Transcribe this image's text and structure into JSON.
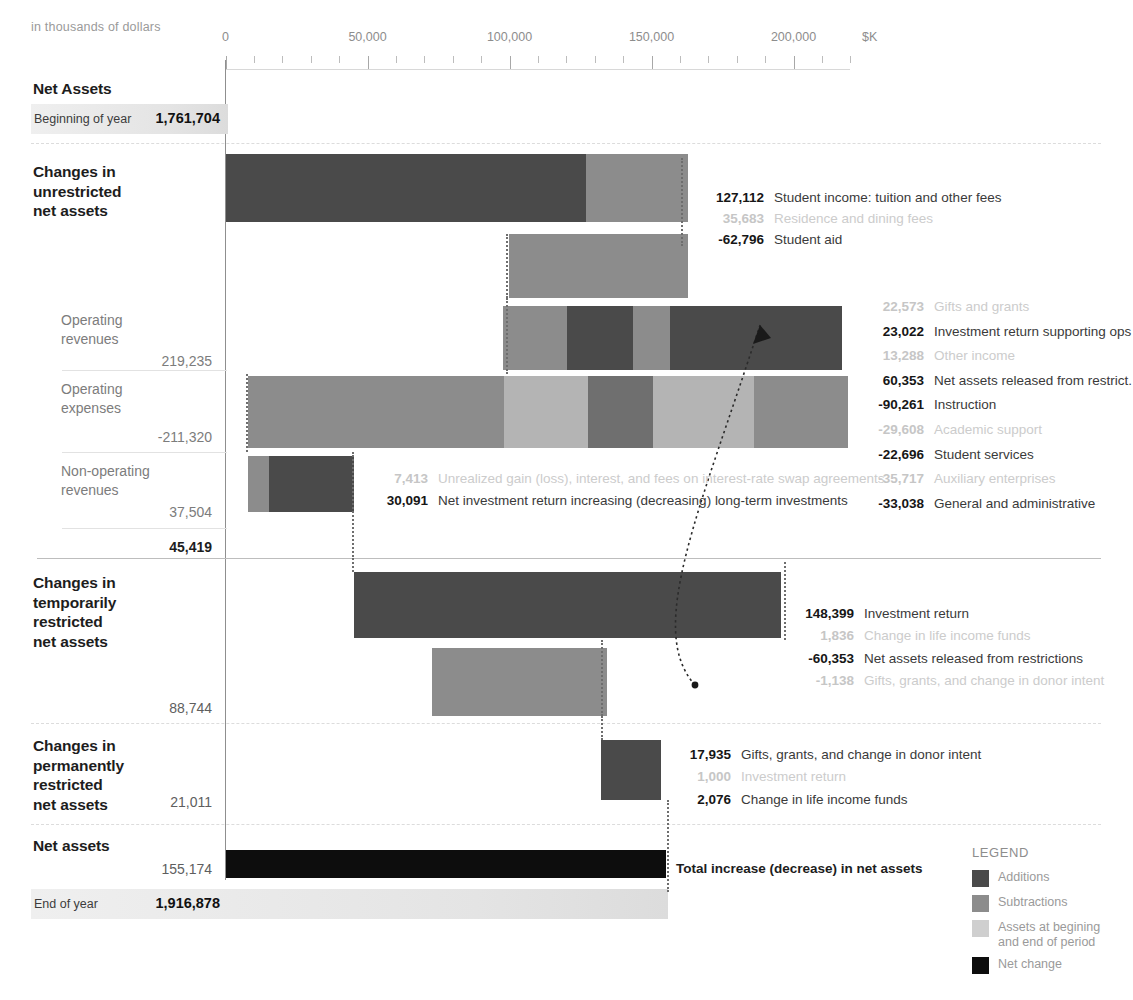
{
  "subtitle": "in thousands of dollars",
  "colors": {
    "addition": "#4a4a4a",
    "subtraction": "#8c8c8c",
    "assets": "#dcdcdc",
    "net_change": "#0d0d0d",
    "axis": "#8f8f8f",
    "dim_text": "#c8c8c8"
  },
  "axis": {
    "unit_label": "$K",
    "ticks": [
      {
        "value": 0,
        "label": "0"
      },
      {
        "value": 50000,
        "label": "50,000"
      },
      {
        "value": 100000,
        "label": "100,000"
      },
      {
        "value": 150000,
        "label": "150,000"
      },
      {
        "value": 200000,
        "label": "200,000"
      }
    ],
    "min": 0,
    "max": 220000,
    "minor_step": 10000
  },
  "net_assets_begin": {
    "section_title": "Net Assets",
    "row_label": "Beginning of year",
    "value": "1,761,704"
  },
  "net_assets_end": {
    "section_title": "Net assets",
    "row_label": "End of year",
    "value": "1,916,878",
    "net_change_value": "155,174",
    "net_change_label": "Total increase (decrease) in net assets"
  },
  "sections": [
    {
      "title": "Changes in\nunrestricted\nnet assets",
      "subtotal": "45,419",
      "subgroups": [
        {
          "label": "Operating\nrevenues",
          "total": "219,235"
        },
        {
          "label": "Operating\nexpenses",
          "total": "-211,320"
        },
        {
          "label": "Non-operating\nrevenues",
          "total": "37,504"
        }
      ]
    },
    {
      "title": "Changes in\ntemporarily\nrestricted\nnet assets",
      "subtotal": "88,744"
    },
    {
      "title": "Changes in\npermanently\nrestricted\nnet assets",
      "subtotal": "21,011"
    }
  ],
  "legend": {
    "title": "LEGEND",
    "items": [
      {
        "label": "Additions",
        "color": "#4a4a4a"
      },
      {
        "label": "Subtractions",
        "color": "#8c8c8c"
      },
      {
        "label": "Assets at begining\nand end of period",
        "color": "#cfcfcf"
      },
      {
        "label": "Net change",
        "color": "#0d0d0d"
      }
    ]
  },
  "chart_data": {
    "type": "bar",
    "chart_style": "waterfall-financial-statement",
    "title": "",
    "subtitle": "in thousands of dollars",
    "xlabel": "$K",
    "ylabel": "",
    "xlim": [
      0,
      220000
    ],
    "grid": false,
    "legend_position": "bottom-right",
    "axis_ticks": [
      0,
      50000,
      100000,
      150000,
      200000
    ],
    "bars": [
      {
        "id": "beginning-of-year",
        "group": "Net Assets",
        "row_label": "Beginning of year",
        "total": 1761704,
        "kind": "assets",
        "segments": []
      },
      {
        "id": "unrestricted-revenue-row-1",
        "group": "Changes in unrestricted net assets",
        "start": 0,
        "segments": [
          {
            "label": "Student income: tuition and other fees",
            "value": 127112,
            "kind": "addition",
            "emphasis": "strong"
          },
          {
            "label": "Residence and dining fees",
            "value": 35683,
            "kind": "subtraction",
            "emphasis": "dim"
          }
        ]
      },
      {
        "id": "unrestricted-revenue-row-2",
        "group": "Changes in unrestricted net assets",
        "start": 162795,
        "segments": [
          {
            "label": "Student aid",
            "value": -62796,
            "kind": "subtraction",
            "emphasis": "strong"
          }
        ]
      },
      {
        "id": "operating-revenues",
        "group": "Operating revenues",
        "subtotal": 219235,
        "start": 99999,
        "segments": [
          {
            "label": "Gifts and grants",
            "value": 22573,
            "kind": "subtraction",
            "emphasis": "dim"
          },
          {
            "label": "Investment return supporting ops",
            "value": 23022,
            "kind": "addition",
            "emphasis": "strong"
          },
          {
            "label": "Other income",
            "value": 13288,
            "kind": "subtraction",
            "emphasis": "dim"
          },
          {
            "label": "Net assets released from restrict.",
            "value": 60353,
            "kind": "addition",
            "emphasis": "strong"
          }
        ]
      },
      {
        "id": "operating-expenses",
        "group": "Operating expenses",
        "subtotal": -211320,
        "start": 7900,
        "segments": [
          {
            "label": "Instruction",
            "value": -90261,
            "kind": "subtraction",
            "emphasis": "strong"
          },
          {
            "label": "Academic support",
            "value": -29608,
            "kind": "assets",
            "emphasis": "dim"
          },
          {
            "label": "Student services",
            "value": -22696,
            "kind": "subtraction-dark",
            "emphasis": "strong"
          },
          {
            "label": "Auxiliary enterprises",
            "value": -35717,
            "kind": "assets",
            "emphasis": "dim"
          },
          {
            "label": "General and administrative",
            "value": -33038,
            "kind": "subtraction",
            "emphasis": "strong"
          }
        ]
      },
      {
        "id": "non-operating-revenues",
        "group": "Non-operating revenues",
        "subtotal": 37504,
        "start": 7900,
        "segments": [
          {
            "label": "Unrealized gain (loss), interest, and fees on interest-rate swap agreements",
            "value": 7413,
            "kind": "subtraction",
            "emphasis": "dim"
          },
          {
            "label": "Net investment return increasing (decreasing) long-term investments",
            "value": 30091,
            "kind": "addition",
            "emphasis": "strong"
          }
        ]
      },
      {
        "id": "unrestricted-subtotal",
        "group": "Changes in unrestricted net assets",
        "subtotal": 45419
      },
      {
        "id": "temporarily-restricted-row-1",
        "group": "Changes in temporarily restricted net assets",
        "start": 45419,
        "segments": [
          {
            "label": "Investment return",
            "value": 148399,
            "kind": "addition",
            "emphasis": "strong"
          },
          {
            "label": "Change in life income funds",
            "value": 1836,
            "kind": "addition",
            "emphasis": "dim"
          }
        ]
      },
      {
        "id": "temporarily-restricted-row-2",
        "group": "Changes in temporarily restricted net assets",
        "start": 134353,
        "segments": [
          {
            "label": "Net assets released from restrictions",
            "value": -60353,
            "kind": "subtraction",
            "emphasis": "strong"
          },
          {
            "label": "Gifts, grants, and change in donor intent",
            "value": -1138,
            "kind": "subtraction",
            "emphasis": "dim"
          }
        ]
      },
      {
        "id": "temporarily-restricted-subtotal",
        "group": "Changes in temporarily restricted net assets",
        "subtotal": 88744
      },
      {
        "id": "permanently-restricted",
        "group": "Changes in permanently restricted net assets",
        "subtotal": 21011,
        "start": 132300,
        "segments": [
          {
            "label": "Gifts, grants, and change in donor intent",
            "value": 17935,
            "kind": "addition",
            "emphasis": "strong"
          },
          {
            "label": "Investment return",
            "value": 1000,
            "kind": "addition",
            "emphasis": "dim"
          },
          {
            "label": "Change in life income funds",
            "value": 2076,
            "kind": "addition",
            "emphasis": "strong"
          }
        ]
      },
      {
        "id": "net-change",
        "group": "Net assets",
        "total": 155174,
        "kind": "net_change",
        "label": "Total increase (decrease) in net assets"
      },
      {
        "id": "end-of-year",
        "group": "Net assets",
        "row_label": "End of year",
        "total": 1916878,
        "kind": "assets"
      }
    ]
  },
  "annotations": {
    "unrestricted_top": [
      {
        "value": "127,112",
        "text": "Student income: tuition and other fees",
        "dim": false
      },
      {
        "value": "35,683",
        "text": "Residence and dining fees",
        "dim": true
      },
      {
        "value": "-62,796",
        "text": "Student aid",
        "dim": false
      }
    ],
    "operating": [
      {
        "value": "22,573",
        "text": "Gifts and grants",
        "dim": true
      },
      {
        "value": "23,022",
        "text": "Investment return supporting ops",
        "dim": false
      },
      {
        "value": "13,288",
        "text": "Other income",
        "dim": true
      },
      {
        "value": "60,353",
        "text": "Net assets released from restrict.",
        "dim": false
      },
      {
        "value": "-90,261",
        "text": "Instruction",
        "dim": false
      },
      {
        "value": "-29,608",
        "text": "Academic support",
        "dim": true
      },
      {
        "value": "-22,696",
        "text": "Student services",
        "dim": false
      },
      {
        "value": "-35,717",
        "text": "Auxiliary enterprises",
        "dim": true
      },
      {
        "value": "-33,038",
        "text": "General and administrative",
        "dim": false
      }
    ],
    "nonoperating": [
      {
        "value": "7,413",
        "text": "Unrealized gain (loss), interest, and fees on interest-rate swap agreements",
        "dim": true
      },
      {
        "value": "30,091",
        "text": "Net investment return increasing (decreasing) long-term investments",
        "dim": false
      }
    ],
    "temporarily": [
      {
        "value": "148,399",
        "text": "Investment return",
        "dim": false
      },
      {
        "value": "1,836",
        "text": "Change in life income funds",
        "dim": true
      },
      {
        "value": "-60,353",
        "text": "Net assets released from restrictions",
        "dim": false
      },
      {
        "value": "-1,138",
        "text": "Gifts, grants, and change in donor intent",
        "dim": true
      }
    ],
    "permanently": [
      {
        "value": "17,935",
        "text": "Gifts, grants, and change in donor intent",
        "dim": false
      },
      {
        "value": "1,000",
        "text": "Investment return",
        "dim": true
      },
      {
        "value": "2,076",
        "text": "Change in life income funds",
        "dim": false
      }
    ]
  }
}
